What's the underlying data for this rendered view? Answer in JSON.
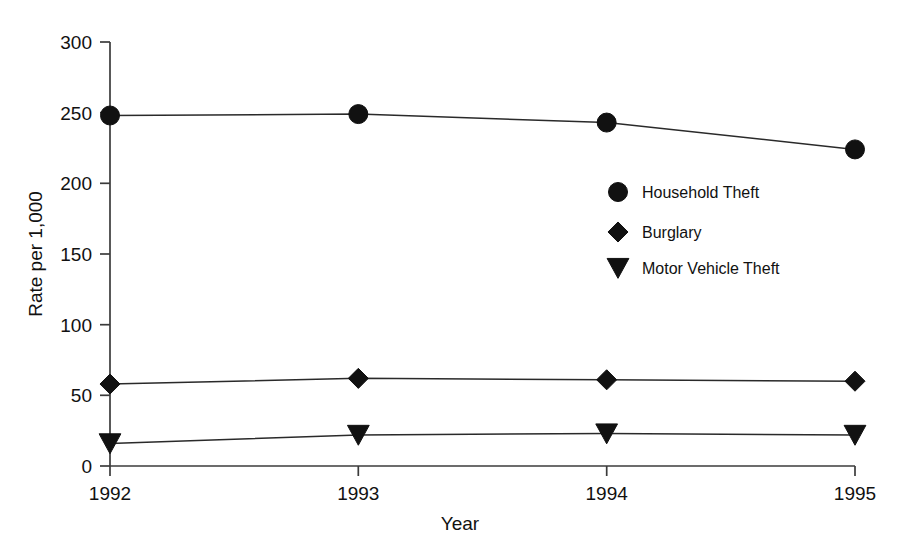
{
  "chart_data": {
    "type": "line",
    "title": "",
    "xlabel": "Year",
    "ylabel": "Rate per 1,000",
    "categories": [
      "1992",
      "1993",
      "1994",
      "1995"
    ],
    "x": [
      1992,
      1993,
      1994,
      1995
    ],
    "xlim": [
      1992,
      1995
    ],
    "ylim": [
      0,
      300
    ],
    "yticks": [
      0,
      50,
      100,
      150,
      200,
      250,
      300
    ],
    "ytick_labels": [
      "0",
      "50",
      "100",
      "150",
      "200",
      "250",
      "300"
    ],
    "grid": false,
    "legend_position": "inside-right-upper",
    "series": [
      {
        "name": "Household Theft",
        "marker": "circle",
        "color": "#111111",
        "values": [
          248,
          249,
          243,
          224
        ]
      },
      {
        "name": "Burglary",
        "marker": "diamond",
        "color": "#111111",
        "values": [
          58,
          62,
          61,
          60
        ]
      },
      {
        "name": "Motor Vehicle Theft",
        "marker": "triangle-down",
        "color": "#111111",
        "values": [
          16,
          22,
          23,
          22
        ]
      }
    ]
  },
  "axes": {
    "y_title": "Rate per 1,000",
    "x_title": "Year",
    "y_tick_0": "0",
    "y_tick_1": "50",
    "y_tick_2": "100",
    "y_tick_3": "150",
    "y_tick_4": "200",
    "y_tick_5": "250",
    "y_tick_6": "300",
    "x_tick_0": "1992",
    "x_tick_1": "1993",
    "x_tick_2": "1994",
    "x_tick_3": "1995"
  },
  "legend": {
    "items": [
      {
        "label": "Household Theft",
        "marker": "circle"
      },
      {
        "label": "Burglary",
        "marker": "diamond"
      },
      {
        "label": "Motor Vehicle Theft",
        "marker": "triangle-down"
      }
    ]
  },
  "colors": {
    "ink": "#111111",
    "axis": "#3b3b3b",
    "background": "#ffffff"
  }
}
